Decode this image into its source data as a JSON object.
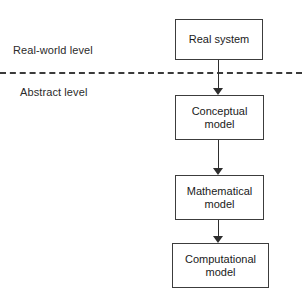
{
  "diagram": {
    "background_color": "#ffffff",
    "line_color": "#3c3c3c",
    "text_color": "#1a1a1a",
    "levels": [
      {
        "id": "real-world",
        "label": "Real-world level"
      },
      {
        "id": "abstract",
        "label": "Abstract level"
      }
    ],
    "divider": {
      "style": "dashed",
      "color": "#3a3a3a"
    },
    "nodes": [
      {
        "id": "real-system",
        "label": "Real system",
        "level": "real-world"
      },
      {
        "id": "conceptual",
        "label": "Conceptual\nmodel",
        "level": "abstract",
        "line1": "Conceptual",
        "line2": "model"
      },
      {
        "id": "mathematical",
        "label": "Mathematical\nmodel",
        "level": "abstract",
        "line1": "Mathematical",
        "line2": "model"
      },
      {
        "id": "computational",
        "label": "Computational\nmodel",
        "level": "abstract",
        "line1": "Computational",
        "line2": "model"
      }
    ],
    "edges": [
      {
        "id": "real-to-conceptual",
        "from": "real-system",
        "to": "conceptual",
        "arrow": "down"
      },
      {
        "id": "conceptual-to-math",
        "from": "conceptual",
        "to": "mathematical",
        "arrow": "down"
      },
      {
        "id": "math-to-computational",
        "from": "mathematical",
        "to": "computational",
        "arrow": "down"
      }
    ]
  }
}
